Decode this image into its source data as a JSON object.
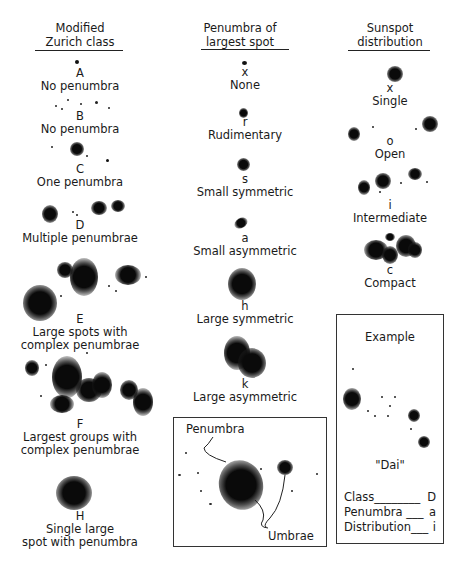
{
  "columns": [
    {
      "header": [
        "Modified",
        "Zurich class"
      ],
      "items": [
        {
          "code": "A",
          "label": [
            "No penumbra"
          ]
        },
        {
          "code": "B",
          "label": [
            "No penumbra"
          ]
        },
        {
          "code": "C",
          "label": [
            "One penumbra"
          ]
        },
        {
          "code": "D",
          "label": [
            "Multiple penumbrae"
          ]
        },
        {
          "code": "E",
          "label": [
            "Large spots with",
            "complex penumbrae"
          ]
        },
        {
          "code": "F",
          "label": [
            "Largest groups with",
            "complex penumbrae"
          ]
        },
        {
          "code": "H",
          "label": [
            "Single large",
            "spot with penumbra"
          ]
        }
      ]
    },
    {
      "header": [
        "Penumbra of",
        "largest spot"
      ],
      "items": [
        {
          "code": "x",
          "label": [
            "None"
          ]
        },
        {
          "code": "r",
          "label": [
            "Rudimentary"
          ]
        },
        {
          "code": "s",
          "label": [
            "Small symmetric"
          ]
        },
        {
          "code": "a",
          "label": [
            "Small asymmetric"
          ]
        },
        {
          "code": "h",
          "label": [
            "Large symmetric"
          ]
        },
        {
          "code": "k",
          "label": [
            "Large asymmetric"
          ]
        }
      ]
    },
    {
      "header": [
        "Sunspot",
        "distribution"
      ],
      "items": [
        {
          "code": "x",
          "label": [
            "Single"
          ]
        },
        {
          "code": "o",
          "label": [
            "Open"
          ]
        },
        {
          "code": "i",
          "label": [
            "Intermediate"
          ]
        },
        {
          "code": "c",
          "label": [
            "Compact"
          ]
        }
      ]
    }
  ],
  "anatomy_box": {
    "penumbra_label": "Penumbra",
    "umbrae_label": "Umbrae"
  },
  "example_box": {
    "title": "Example",
    "designation": "\"Dai\"",
    "rows": [
      {
        "label": "Class",
        "leader": "________",
        "value": "D"
      },
      {
        "label": "Penumbra",
        "leader": "___",
        "value": "a"
      },
      {
        "label": "Distribution",
        "leader": "___",
        "value": "i"
      }
    ]
  }
}
